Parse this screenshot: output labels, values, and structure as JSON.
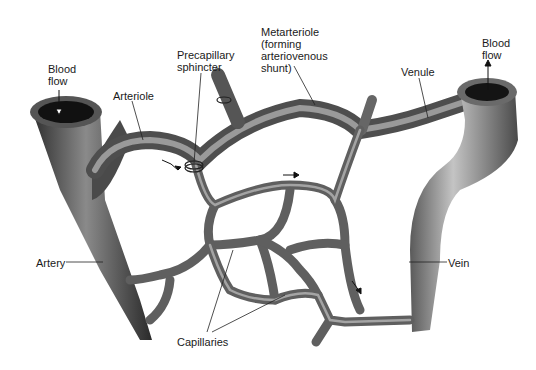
{
  "diagram": {
    "colors": {
      "vessel_dark": "#3a3a3a",
      "vessel_mid": "#7a7a7a",
      "vessel_light": "#b8b8b8",
      "lumen": "#111111",
      "label": "#1a1a1a",
      "background": "#ffffff"
    },
    "labels": [
      {
        "id": "blood-flow-in",
        "text": "Blood\nflow",
        "x": 48,
        "y": 63
      },
      {
        "id": "arteriole",
        "text": "Arteriole",
        "x": 113,
        "y": 90
      },
      {
        "id": "precapillary-sphincter",
        "text": "Precapillary\nsphincter",
        "x": 177,
        "y": 49
      },
      {
        "id": "metarteriole",
        "text": "Metarteriole\n(forming\narteriovenous\nshunt)",
        "x": 261,
        "y": 26
      },
      {
        "id": "venule",
        "text": "Venule",
        "x": 401,
        "y": 66
      },
      {
        "id": "blood-flow-out",
        "text": "Blood\nflow",
        "x": 482,
        "y": 37
      },
      {
        "id": "artery",
        "text": "Artery",
        "x": 36,
        "y": 257
      },
      {
        "id": "vein",
        "text": "Vein",
        "x": 448,
        "y": 258
      },
      {
        "id": "capillaries",
        "text": "Capillaries",
        "x": 177,
        "y": 336
      }
    ]
  }
}
